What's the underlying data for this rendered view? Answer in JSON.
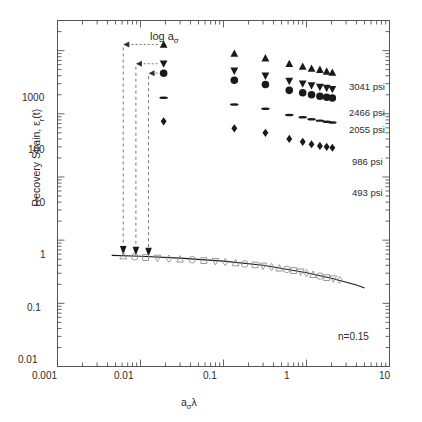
{
  "figure": {
    "type": "scatter-loglog",
    "background": "#ffffff",
    "axis_color": "#555555",
    "marker_color": "#1a1a1a",
    "open_marker_color": "#8a8a8a",
    "dash_color": "#777777"
  },
  "axes": {
    "x": {
      "label_main": "a",
      "label_sub": "σ",
      "label_tail": "λ",
      "label_plain": "aσλ",
      "scale": "log",
      "min": 0.001,
      "max": 10,
      "ticks": [
        "0.001",
        "0.01",
        "0.1",
        "1",
        "10"
      ],
      "tick_values": [
        0.001,
        0.01,
        0.1,
        1,
        10
      ]
    },
    "y": {
      "label_pre": "Recovery Strain, ",
      "label_eps": "ε",
      "label_sub": "r",
      "label_post": "(t)",
      "label_plain": "Recovery Strain, εr(t)",
      "scale": "log",
      "min": 0.01,
      "max": 3000,
      "ticks": [
        "0.01",
        "0.1",
        "1",
        "10",
        "100",
        "1000"
      ],
      "tick_values": [
        0.01,
        0.1,
        1,
        10,
        100,
        1000
      ]
    }
  },
  "annotations": {
    "shift_label_main": "log a",
    "shift_label_sub": "σ",
    "shift_label_plain": "log aσ",
    "exponent_label": "n=0.15"
  },
  "legend": {
    "position": "right-inside",
    "entries": [
      {
        "label": "3041 psi",
        "marker": "triangle-up",
        "value": 3041,
        "unit": "psi"
      },
      {
        "label": "2466 psi",
        "marker": "triangle-down",
        "value": 2466,
        "unit": "psi"
      },
      {
        "label": "2055 psi",
        "marker": "circle",
        "value": 2055,
        "unit": "psi"
      },
      {
        "label": "986 psi",
        "marker": "ellipse-flat",
        "value": 986,
        "unit": "psi"
      },
      {
        "label": "493 psi",
        "marker": "diamond",
        "value": 493,
        "unit": "psi"
      }
    ]
  },
  "chart_data": {
    "type": "scatter",
    "title": "",
    "xlabel": "aσλ",
    "ylabel": "Recovery Strain, εr(t)",
    "xscale": "log",
    "yscale": "log",
    "xlim": [
      0.001,
      10
    ],
    "ylim": [
      0.01,
      3000
    ],
    "grid": false,
    "legend_position": "right-inside",
    "annotations": [
      {
        "text": "log aσ",
        "x": 0.012,
        "y": 1900,
        "kind": "shift-factor-label"
      },
      {
        "text": "n=0.15",
        "x": 3.4,
        "y": 0.17,
        "kind": "power-law-exponent"
      }
    ],
    "series": [
      {
        "name": "3041 psi",
        "marker": "triangle-up",
        "filled": true,
        "x": [
          0.019,
          0.135,
          0.32,
          0.62,
          0.9,
          1.15,
          1.45,
          1.75,
          2.05
        ],
        "y": [
          1250,
          900,
          760,
          620,
          560,
          520,
          500,
          470,
          450
        ]
      },
      {
        "name": "2466 psi",
        "marker": "triangle-down",
        "filled": true,
        "x": [
          0.019,
          0.135,
          0.32,
          0.62,
          0.9,
          1.15,
          1.45,
          1.75,
          2.05
        ],
        "y": [
          620,
          480,
          400,
          330,
          300,
          280,
          265,
          255,
          245
        ]
      },
      {
        "name": "2055 psi",
        "marker": "circle",
        "filled": true,
        "x": [
          0.019,
          0.135,
          0.32,
          0.62,
          0.9,
          1.15,
          1.45,
          1.75,
          2.05
        ],
        "y": [
          440,
          340,
          290,
          235,
          215,
          200,
          190,
          183,
          178
        ]
      },
      {
        "name": "986 psi",
        "marker": "ellipse-flat",
        "filled": true,
        "x": [
          0.019,
          0.135,
          0.32,
          0.62,
          0.9,
          1.15,
          1.45,
          1.75,
          2.05
        ],
        "y": [
          180,
          140,
          120,
          96,
          88,
          82,
          78,
          75,
          73
        ]
      },
      {
        "name": "493 psi",
        "marker": "diamond",
        "filled": true,
        "x": [
          0.019,
          0.135,
          0.32,
          0.62,
          0.9,
          1.15,
          1.45,
          1.75,
          2.05
        ],
        "y": [
          76,
          59,
          50,
          40,
          36,
          33,
          31,
          30,
          29
        ]
      },
      {
        "name": "master curve (shifted data)",
        "marker": "open-mixed",
        "filled": false,
        "x": [
          0.0062,
          0.0085,
          0.0115,
          0.016,
          0.022,
          0.03,
          0.042,
          0.058,
          0.08,
          0.105,
          0.14,
          0.18,
          0.24,
          0.3,
          0.38,
          0.47,
          0.58,
          0.7,
          0.85,
          1.0,
          1.2,
          1.45,
          1.75,
          2.1,
          2.5
        ],
        "y": [
          0.56,
          0.545,
          0.53,
          0.52,
          0.51,
          0.5,
          0.49,
          0.475,
          0.46,
          0.45,
          0.435,
          0.42,
          0.405,
          0.39,
          0.375,
          0.36,
          0.345,
          0.33,
          0.315,
          0.3,
          0.285,
          0.27,
          0.255,
          0.245,
          0.235
        ]
      }
    ],
    "fit_line": {
      "name": "power-law fit n=0.15",
      "exponent_n": 0.15,
      "x": [
        0.0045,
        0.01,
        0.03,
        0.1,
        0.3,
        1.0,
        2.0,
        4.0,
        5.0
      ],
      "y": [
        0.575,
        0.555,
        0.52,
        0.465,
        0.4,
        0.305,
        0.25,
        0.195,
        0.175
      ]
    },
    "shift_arrows": [
      {
        "from_x": 0.019,
        "from_y": 1250,
        "to_x": 0.0062,
        "to_y": 1250,
        "then_to_y": 0.56,
        "series": "3041 psi"
      },
      {
        "from_x": 0.019,
        "from_y": 620,
        "to_x": 0.0088,
        "to_y": 620,
        "then_to_y": 0.545,
        "series": "2466 psi"
      },
      {
        "from_x": 0.019,
        "from_y": 440,
        "to_x": 0.0125,
        "to_y": 440,
        "then_to_y": 0.525,
        "series": "2055 psi"
      }
    ]
  }
}
